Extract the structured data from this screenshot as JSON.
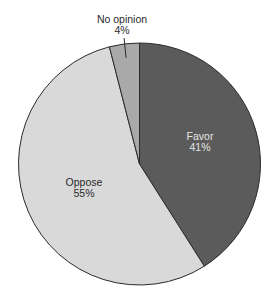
{
  "chart_data": {
    "type": "pie",
    "title": "",
    "start_angle_deg": 0,
    "direction": "clockwise",
    "slices": [
      {
        "label": "Favor",
        "value": 41,
        "display": "41%",
        "color": "#5b5b5b",
        "label_color": "#e6e6e6",
        "label_position": "inside"
      },
      {
        "label": "Oppose",
        "value": 55,
        "display": "55%",
        "color": "#d9d9d9",
        "label_color": "#2a2a2a",
        "label_position": "inside"
      },
      {
        "label": "No opinion",
        "value": 4,
        "display": "4%",
        "color": "#a9a9a9",
        "label_color": "#2a2a2a",
        "label_position": "outside"
      }
    ],
    "legend": "none",
    "edge_color": "#2b2b2b"
  }
}
